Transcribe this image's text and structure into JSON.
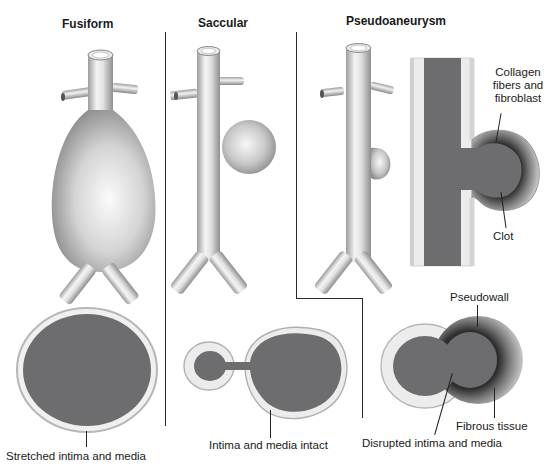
{
  "figure": {
    "cropped_header_text": "",
    "panels": [
      {
        "id": "fusiform",
        "title": "Fusiform",
        "cross_section_label": "Stretched intima and media"
      },
      {
        "id": "saccular",
        "title": "Saccular",
        "cross_section_label": "Intima and media intact"
      },
      {
        "id": "pseudoaneurysm",
        "title": "Pseudoaneurysm",
        "longitudinal_labels": {
          "wall": "Collagen\nfibers and\nfibroblast",
          "wall_lines": [
            "Collagen",
            "fibers and",
            "fibroblast"
          ],
          "clot": "Clot"
        },
        "cross_section_labels": {
          "pseudowall": "Pseudowall",
          "fibrous": "Fibrous tissue",
          "disrupted": "Disrupted intima and media"
        }
      }
    ],
    "colors": {
      "lumen": "#6d6d70",
      "vessel_light": "#f2f2f2",
      "vessel_shade": "#9a9a9a",
      "divider": "#2a2a2a",
      "wall": "#d9d9d9",
      "clot_dark": "#3a3a3a"
    }
  }
}
